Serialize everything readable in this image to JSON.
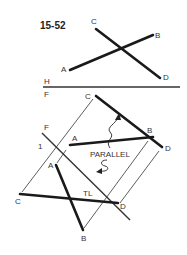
{
  "figure": {
    "number": "15-52"
  },
  "top_view": {
    "labels": {
      "A": "A",
      "B": "B",
      "C": "C",
      "D": "D"
    }
  },
  "folding_lines": {
    "hf": {
      "upper": "H",
      "lower": "F"
    },
    "f1": {
      "upper": "F",
      "lower": "1"
    }
  },
  "front_view": {
    "labels": {
      "A": "A",
      "B": "B",
      "C": "C",
      "D": "D"
    },
    "annotation": "PARALLEL"
  },
  "aux_view": {
    "labels": {
      "A": "A",
      "B": "B",
      "C": "C",
      "D": "D"
    },
    "annotation": "TL"
  },
  "colors": {
    "line": "#1a1a1a",
    "background": "#ffffff"
  }
}
